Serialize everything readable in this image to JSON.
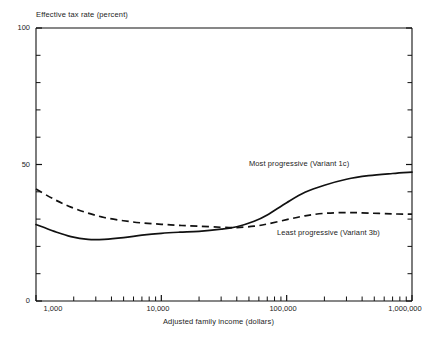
{
  "chart_data": {
    "type": "line",
    "title": "",
    "xlabel": "Adjusted family income (dollars)",
    "ylabel": "Effective tax rate (percent)",
    "xscale": "log",
    "xlim": [
      1000,
      1000000
    ],
    "ylim": [
      0,
      100
    ],
    "ytick_labels": [
      "0",
      "50",
      "100"
    ],
    "ytick_values": [
      0,
      50,
      100
    ],
    "yminor_step": 10,
    "xtick_labels": [
      "1,000",
      "10,000",
      "100,000",
      "1,000,000"
    ],
    "xtick_values": [
      1000,
      10000,
      100000,
      1000000
    ],
    "grid": false,
    "legend_position": "inline-annotations",
    "series": [
      {
        "name": "Most progressive (Variant 1c)",
        "style": "solid",
        "color": "#111111",
        "annotation": "Most progressive (Variant 1c)",
        "x": [
          1000,
          1400,
          1900,
          2600,
          3500,
          5000,
          7000,
          10000,
          14000,
          20000,
          30000,
          40000,
          55000,
          70000,
          100000,
          140000,
          200000,
          300000,
          450000,
          700000,
          1000000
        ],
        "y": [
          28,
          25.5,
          23.6,
          22.6,
          22.6,
          23.2,
          24.1,
          24.8,
          25.2,
          25.5,
          26.3,
          27.2,
          29.2,
          31.5,
          36.0,
          39.8,
          42.4,
          44.6,
          45.9,
          46.7,
          47.2
        ]
      },
      {
        "name": "Least progressive (Variant 3b)",
        "style": "dashed",
        "color": "#111111",
        "annotation": "Least progressive (Variant 3b)",
        "x": [
          1000,
          1400,
          1900,
          2600,
          3500,
          5000,
          7000,
          10000,
          14000,
          20000,
          30000,
          40000,
          55000,
          70000,
          100000,
          140000,
          200000,
          300000,
          450000,
          700000,
          1000000
        ],
        "y": [
          41.0,
          37.2,
          34.4,
          32.2,
          30.6,
          29.4,
          28.6,
          28.1,
          27.7,
          27.4,
          27.0,
          26.9,
          27.4,
          28.2,
          29.8,
          31.2,
          32.1,
          32.4,
          32.2,
          31.9,
          31.8
        ]
      }
    ],
    "annotations": [
      {
        "text": "Most progressive (Variant 1c)",
        "x": 52000,
        "y": 56
      },
      {
        "text": "Least progressive (Variant 3b)",
        "x": 150000,
        "y": 25
      }
    ]
  }
}
